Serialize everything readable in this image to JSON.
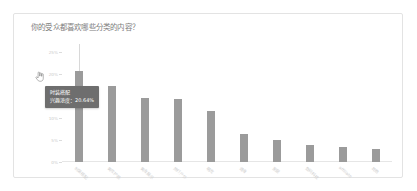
{
  "card": {
    "title": "你的受众都喜欢哪些分类的内容？"
  },
  "tooltip": {
    "category": "时装搭配",
    "metric_label": "兴趣浓度：",
    "metric_value": "20.64%"
  },
  "cursor": {
    "icon": "pointing-hand-cursor"
  },
  "colors": {
    "bar": "#9b9b9b",
    "tooltip_bg": "#6e6e6e",
    "card_border": "#e3e3e3",
    "title_text": "#7d7d7d",
    "tick_text": "#c9c9c9"
  },
  "chart_data": {
    "type": "bar",
    "title": "你的受众都喜欢哪些分类的内容？",
    "xlabel": "",
    "ylabel": "",
    "ylim": [
      0,
      25
    ],
    "grid": false,
    "legend": null,
    "ytick_labels": [
      "25%",
      "20%",
      "15%",
      "10%",
      "5%",
      "0%"
    ],
    "ytick_values": [
      25,
      20,
      15,
      10,
      5,
      0
    ],
    "categories": [
      "时装搭配",
      "美妆护肤",
      "美食展示",
      "旅行户外",
      "萌宠",
      "健身",
      "家居",
      "数码科技",
      "affiliate",
      "其他"
    ],
    "values": [
      20.64,
      17.2,
      14.6,
      14.3,
      11.6,
      6.4,
      5.0,
      3.9,
      3.5,
      3.0
    ],
    "highlighted_index": 0
  }
}
